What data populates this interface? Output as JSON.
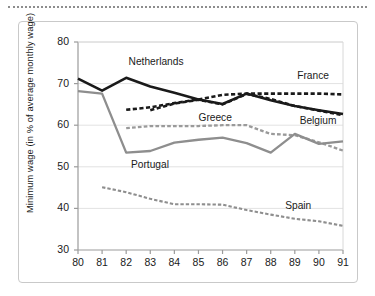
{
  "figure": {
    "ylabel": "Minimum wage (in % of average monthly wage)"
  },
  "chart_data": {
    "type": "line",
    "title": "",
    "xlabel": "",
    "ylabel": "Minimum wage (in % of average monthly wage)",
    "x": [
      80,
      81,
      82,
      83,
      84,
      85,
      86,
      87,
      88,
      89,
      90,
      91
    ],
    "xticklabels": [
      "80",
      "81",
      "82",
      "83",
      "84",
      "85",
      "86",
      "87",
      "88",
      "89",
      "90",
      "91"
    ],
    "yticklabels": [
      "30",
      "40",
      "50",
      "60",
      "70",
      "80"
    ],
    "yticks": [
      30,
      40,
      50,
      60,
      70,
      80
    ],
    "xlim": [
      80,
      91
    ],
    "ylim": [
      30,
      80
    ],
    "grid": true,
    "grid_axis": "y",
    "legend": "inline-annotations",
    "series": [
      {
        "name": "Netherlands",
        "style": "solid",
        "color": "#1a1a1a",
        "width": 2.6,
        "x": [
          80,
          81,
          82,
          83,
          84,
          85,
          86,
          87,
          88,
          89,
          90,
          91
        ],
        "values": [
          71.2,
          68.3,
          71.4,
          69.3,
          67.8,
          66.2,
          65.1,
          67.6,
          66.0,
          64.6,
          63.6,
          62.7
        ],
        "label_x": 82.1,
        "label_y": 75.0
      },
      {
        "name": "France",
        "style": "dashed",
        "color": "#1a1a1a",
        "width": 2.6,
        "x": [
          82,
          83,
          84,
          85,
          86,
          87,
          88,
          89,
          90,
          91
        ],
        "values": [
          63.7,
          64.3,
          65.3,
          66.2,
          67.3,
          67.6,
          67.6,
          67.6,
          67.6,
          67.4
        ],
        "label_x": 89.1,
        "label_y": 71.5
      },
      {
        "name": "Belgium",
        "style": "dashed",
        "color": "#1a1a1a",
        "width": 2.6,
        "x": [
          83,
          84,
          85,
          86,
          87,
          88,
          89,
          90,
          91
        ],
        "values": [
          63.6,
          65.2,
          66.1,
          65.0,
          67.5,
          66.3,
          64.6,
          63.5,
          62.4
        ],
        "label_x": 89.2,
        "label_y": 60.7
      },
      {
        "name": "Greece",
        "style": "dashed",
        "color": "#9a9a9a",
        "width": 2.3,
        "x": [
          82,
          83,
          84,
          85,
          86,
          87,
          88,
          89,
          90,
          91
        ],
        "values": [
          59.3,
          59.8,
          59.8,
          59.8,
          60.0,
          60.0,
          57.9,
          57.6,
          55.9,
          53.9
        ],
        "label_x": 85.0,
        "label_y": 61.6
      },
      {
        "name": "Portugal",
        "style": "solid",
        "color": "#8e8e8e",
        "width": 2.3,
        "x": [
          80,
          81,
          82,
          83,
          84,
          85,
          86,
          87,
          88,
          89,
          90,
          91
        ],
        "values": [
          68.2,
          67.6,
          53.4,
          53.8,
          55.8,
          56.5,
          57.0,
          55.7,
          53.4,
          57.9,
          55.5,
          56.1
        ],
        "label_x": 82.2,
        "label_y": 50.2
      },
      {
        "name": "Spain",
        "style": "dashed",
        "color": "#8e8e8e",
        "width": 2.1,
        "x": [
          81,
          82,
          83,
          84,
          85,
          86,
          87,
          88,
          89,
          90,
          91
        ],
        "values": [
          45.1,
          43.9,
          42.3,
          41.0,
          41.0,
          40.9,
          39.6,
          38.5,
          37.5,
          36.9,
          35.8
        ],
        "label_x": 88.6,
        "label_y": 40.3
      }
    ]
  }
}
